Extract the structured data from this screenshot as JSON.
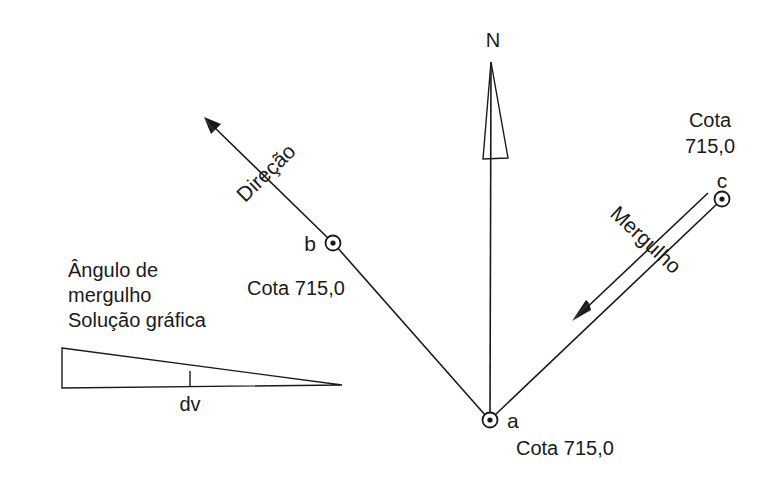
{
  "figure": {
    "title_implicit": "Diagrama de direção e mergulho",
    "background_color": "#ffffff",
    "line_color": "#1a1a1a",
    "text_color": "#1a1a1a"
  },
  "compass": {
    "label": "N",
    "needle_type": "north-arrow-triangle"
  },
  "points": [
    {
      "id": "a",
      "label": "a",
      "elevation_label": "Cota 715,0",
      "x": 490,
      "y": 420
    },
    {
      "id": "b",
      "label": "b",
      "elevation_label": "Cota 715,0",
      "x": 333,
      "y": 243
    },
    {
      "id": "c",
      "label": "c",
      "elevation_label_line1": "Cota",
      "elevation_label_line2": "715,0",
      "x": 722,
      "y": 199
    }
  ],
  "annotations": {
    "direcao_label": "Direção",
    "mergulho_label": "Mergulho",
    "dv_label": "dv"
  },
  "left_note": {
    "line1": "Ângulo de",
    "line2": "mergulho",
    "line3": "Solução gráfica"
  },
  "icon_names": {
    "north_arrow": "north-arrow-icon",
    "point_marker": "survey-point-marker-icon",
    "direction_arrow": "direction-arrow-icon",
    "dip_arrow": "dip-arrow-icon",
    "dip_wedge": "dip-angle-wedge-icon"
  }
}
